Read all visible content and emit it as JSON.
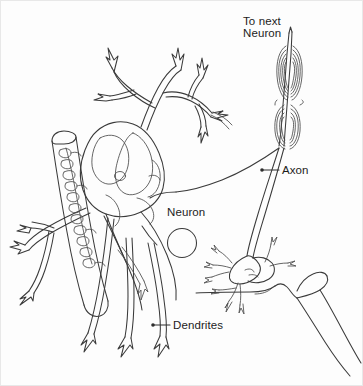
{
  "figure": {
    "background_color": "#fdfdfd",
    "ink_color": "#3a3a3a",
    "border_color": "#e8e8e8"
  },
  "labels": {
    "to_next_neuron_line1": "To next",
    "to_next_neuron_line2": "Neuron",
    "axon": "Axon",
    "neuron": "Neuron",
    "dendrites": "Dendrites"
  },
  "parts": [
    {
      "name": "to-next-neuron",
      "label": "To next Neuron",
      "has_leader": false,
      "x": 243,
      "y": 22
    },
    {
      "name": "axon",
      "label": "Axon",
      "has_leader": true,
      "x": 283,
      "y": 172
    },
    {
      "name": "neuron",
      "label": "Neuron",
      "has_leader": false,
      "x": 167,
      "y": 214
    },
    {
      "name": "dendrites",
      "label": "Dendrites",
      "has_leader": true,
      "x": 171,
      "y": 327
    }
  ],
  "structures": [
    "myelinated-axon-terminal",
    "axon-fiber",
    "soma-cell-body",
    "nucleus",
    "dendrite-tree",
    "synaptic-terminals",
    "target-neuron-dendrite",
    "crossing-fiber-with-windings"
  ]
}
